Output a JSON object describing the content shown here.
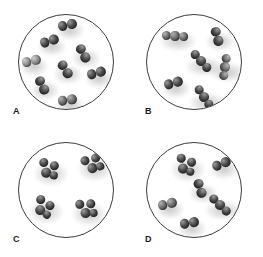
{
  "figure": {
    "background_color": "#ffffff",
    "circle_stroke_color": "#3c3c3c",
    "atom_color_dark": "#4a4a4a",
    "atom_color_mid": "#6e6e6e",
    "atom_color_light": "#8f8f8f",
    "label_color": "#1a1a1a"
  },
  "panels": [
    {
      "id": "A",
      "label": "A",
      "label_x": 13,
      "label_y": 107,
      "circle": {
        "cx": 66,
        "cy": 62,
        "r": 48
      },
      "molecule_count": 8,
      "composition": "eight identical diatomic molecules",
      "molecules": [
        {
          "atoms": 2,
          "x": 66,
          "y": 24,
          "rot": -12,
          "size": 9.5,
          "shade": "dark"
        },
        {
          "atoms": 2,
          "x": 48,
          "y": 40,
          "rot": -18,
          "size": 9.5,
          "shade": "dark"
        },
        {
          "atoms": 2,
          "x": 82,
          "y": 52,
          "rot": 62,
          "size": 9.5,
          "shade": "dark"
        },
        {
          "atoms": 2,
          "x": 30,
          "y": 60,
          "rot": -14,
          "size": 9.5,
          "shade": "light"
        },
        {
          "atoms": 2,
          "x": 64,
          "y": 68,
          "rot": 58,
          "size": 9.5,
          "shade": "dark"
        },
        {
          "atoms": 2,
          "x": 95,
          "y": 72,
          "rot": -16,
          "size": 9.5,
          "shade": "dark"
        },
        {
          "atoms": 2,
          "x": 41,
          "y": 84,
          "rot": 64,
          "size": 9.5,
          "shade": "dark"
        },
        {
          "atoms": 2,
          "x": 66,
          "y": 99,
          "rot": -8,
          "size": 9.5,
          "shade": "mid"
        }
      ]
    },
    {
      "id": "B",
      "label": "B",
      "label_x": 145,
      "label_y": 107,
      "circle": {
        "cx": 194,
        "cy": 62,
        "r": 48
      },
      "molecule_count": 6,
      "composition": "six molecules: a mixture of diatomic and triatomic clusters",
      "molecules": [
        {
          "atoms": 3,
          "x": 174,
          "y": 35,
          "rot": -6,
          "size": 9.5,
          "shade": "mid"
        },
        {
          "atoms": 2,
          "x": 216,
          "y": 35,
          "rot": 74,
          "size": 9.5,
          "shade": "dark"
        },
        {
          "atoms": 3,
          "x": 200,
          "y": 60,
          "rot": 38,
          "size": 9.5,
          "shade": "dark"
        },
        {
          "atoms": 3,
          "x": 224,
          "y": 66,
          "rot": 88,
          "size": 9.5,
          "shade": "mid"
        },
        {
          "atoms": 2,
          "x": 172,
          "y": 82,
          "rot": -16,
          "size": 9.5,
          "shade": "dark"
        },
        {
          "atoms": 3,
          "x": 203,
          "y": 96,
          "rot": 46,
          "size": 9.5,
          "shade": "dark"
        }
      ]
    },
    {
      "id": "C",
      "label": "C",
      "label_x": 13,
      "label_y": 235,
      "circle": {
        "cx": 66,
        "cy": 190,
        "r": 48
      },
      "molecule_count": 4,
      "composition": "four identical tetrahedral four-sphere clusters",
      "molecules": [
        {
          "atoms": 4,
          "x": 47,
          "y": 168,
          "rot": 12,
          "size": 9.5,
          "shade": "dark"
        },
        {
          "atoms": 4,
          "x": 91,
          "y": 163,
          "rot": -20,
          "size": 9.5,
          "shade": "dark"
        },
        {
          "atoms": 4,
          "x": 42,
          "y": 206,
          "rot": 28,
          "size": 9.5,
          "shade": "dark"
        },
        {
          "atoms": 4,
          "x": 85,
          "y": 208,
          "rot": -8,
          "size": 9.5,
          "shade": "dark"
        }
      ]
    },
    {
      "id": "D",
      "label": "D",
      "label_x": 145,
      "label_y": 235,
      "circle": {
        "cx": 194,
        "cy": 190,
        "r": 48
      },
      "molecule_count": 6,
      "composition": "six molecules: a mixture of diatomic and triatomic clusters",
      "molecules": [
        {
          "atoms": 4,
          "x": 184,
          "y": 164,
          "rot": 16,
          "size": 9.5,
          "shade": "dark"
        },
        {
          "atoms": 2,
          "x": 220,
          "y": 163,
          "rot": -22,
          "size": 9.5,
          "shade": "dark"
        },
        {
          "atoms": 2,
          "x": 199,
          "y": 187,
          "rot": 72,
          "size": 9.5,
          "shade": "dark"
        },
        {
          "atoms": 2,
          "x": 166,
          "y": 203,
          "rot": -14,
          "size": 9.5,
          "shade": "mid"
        },
        {
          "atoms": 3,
          "x": 219,
          "y": 204,
          "rot": 34,
          "size": 9.5,
          "shade": "dark"
        },
        {
          "atoms": 2,
          "x": 188,
          "y": 222,
          "rot": -10,
          "size": 9.5,
          "shade": "dark"
        }
      ]
    }
  ]
}
